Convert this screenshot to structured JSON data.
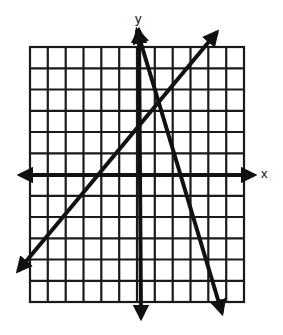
{
  "graph": {
    "x_label": "x",
    "y_label": "y",
    "grid": {
      "columns": 12,
      "rows": 12,
      "x_range": [
        -6,
        6
      ],
      "y_range": [
        -6,
        6
      ]
    },
    "colors": {
      "line": "#111111",
      "grid": "#1a1a1a",
      "background": "#ffffff"
    },
    "lines": [
      {
        "name": "line-positive-slope",
        "equation": "y = x + 2",
        "slope": 1,
        "intercept": 2
      },
      {
        "name": "line-negative-slope",
        "equation": "y = -3x + 6",
        "slope": -3,
        "intercept": 6
      }
    ],
    "intersection": {
      "x": 1,
      "y": 3
    }
  }
}
